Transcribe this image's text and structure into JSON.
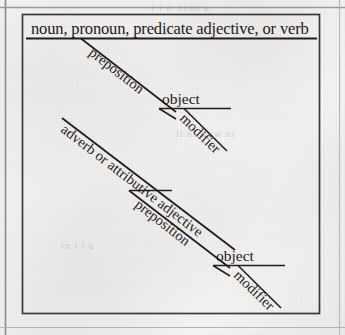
{
  "page": {
    "width": 345,
    "height": 335,
    "background_color": "#f2f1ef",
    "ink_color": "#1b1a19",
    "rule_color": "#2a2928"
  },
  "diagram": {
    "type": "reed-kellogg-sentence-diagram",
    "title_text": "noun, pronoun, predicate adjective, or verb",
    "groups": [
      {
        "name": "upper-group",
        "base_label": "noun, pronoun, predicate adjective, or verb",
        "preposition_label": "preposition",
        "object_label": "object",
        "modifier_label": "modifier"
      },
      {
        "name": "lower-group",
        "base_label": "adverb or attributive adjective",
        "preposition_label": "preposition",
        "object_label": "object",
        "modifier_label": "modifier"
      }
    ]
  },
  "labels": {
    "base_top": "noun, pronoun, predicate adjective, or verb",
    "preposition_top": "preposition",
    "object_top": "object",
    "modifier_top": "modifier",
    "base_bottom": "adverb or attributive adjective",
    "preposition_bottom": "preposition",
    "object_bottom": "object",
    "modifier_bottom": "modifier"
  },
  "ghost_text": {
    "top_bleed": "a nnin n i i",
    "mid_bleed": "in with in it",
    "low_bleed": "a l i ni"
  }
}
